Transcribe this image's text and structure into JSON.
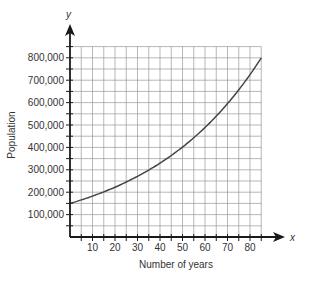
{
  "chart_data": {
    "type": "line",
    "title": "",
    "xlabel": "Number of years",
    "ylabel": "Population",
    "x_axis_letter": "x",
    "y_axis_letter": "y",
    "xlim": [
      0,
      85
    ],
    "ylim": [
      0,
      850000
    ],
    "x_ticks": [
      10,
      20,
      30,
      40,
      50,
      60,
      70,
      80
    ],
    "x_tick_labels": [
      "10",
      "20",
      "30",
      "40",
      "50",
      "60",
      "70",
      "80"
    ],
    "y_ticks": [
      100000,
      200000,
      300000,
      400000,
      500000,
      600000,
      700000,
      800000
    ],
    "y_tick_labels": [
      "100,000",
      "200,000",
      "300,000",
      "400,000",
      "500,000",
      "600,000",
      "700,000",
      "800,000"
    ],
    "grid": true,
    "grid_x_step": 5,
    "grid_y_step": 50000,
    "legend": null,
    "series": [
      {
        "name": "Population",
        "x": [
          0,
          10,
          20,
          30,
          40,
          50,
          60,
          70,
          80,
          85
        ],
        "values": [
          150000,
          182000,
          222000,
          270000,
          329000,
          401000,
          488000,
          594000,
          723000,
          800000
        ]
      }
    ]
  },
  "colors": {
    "axis": "#1a1a1a",
    "grid": "#9a9a9a",
    "curve": "#444444",
    "text": "#333333"
  }
}
